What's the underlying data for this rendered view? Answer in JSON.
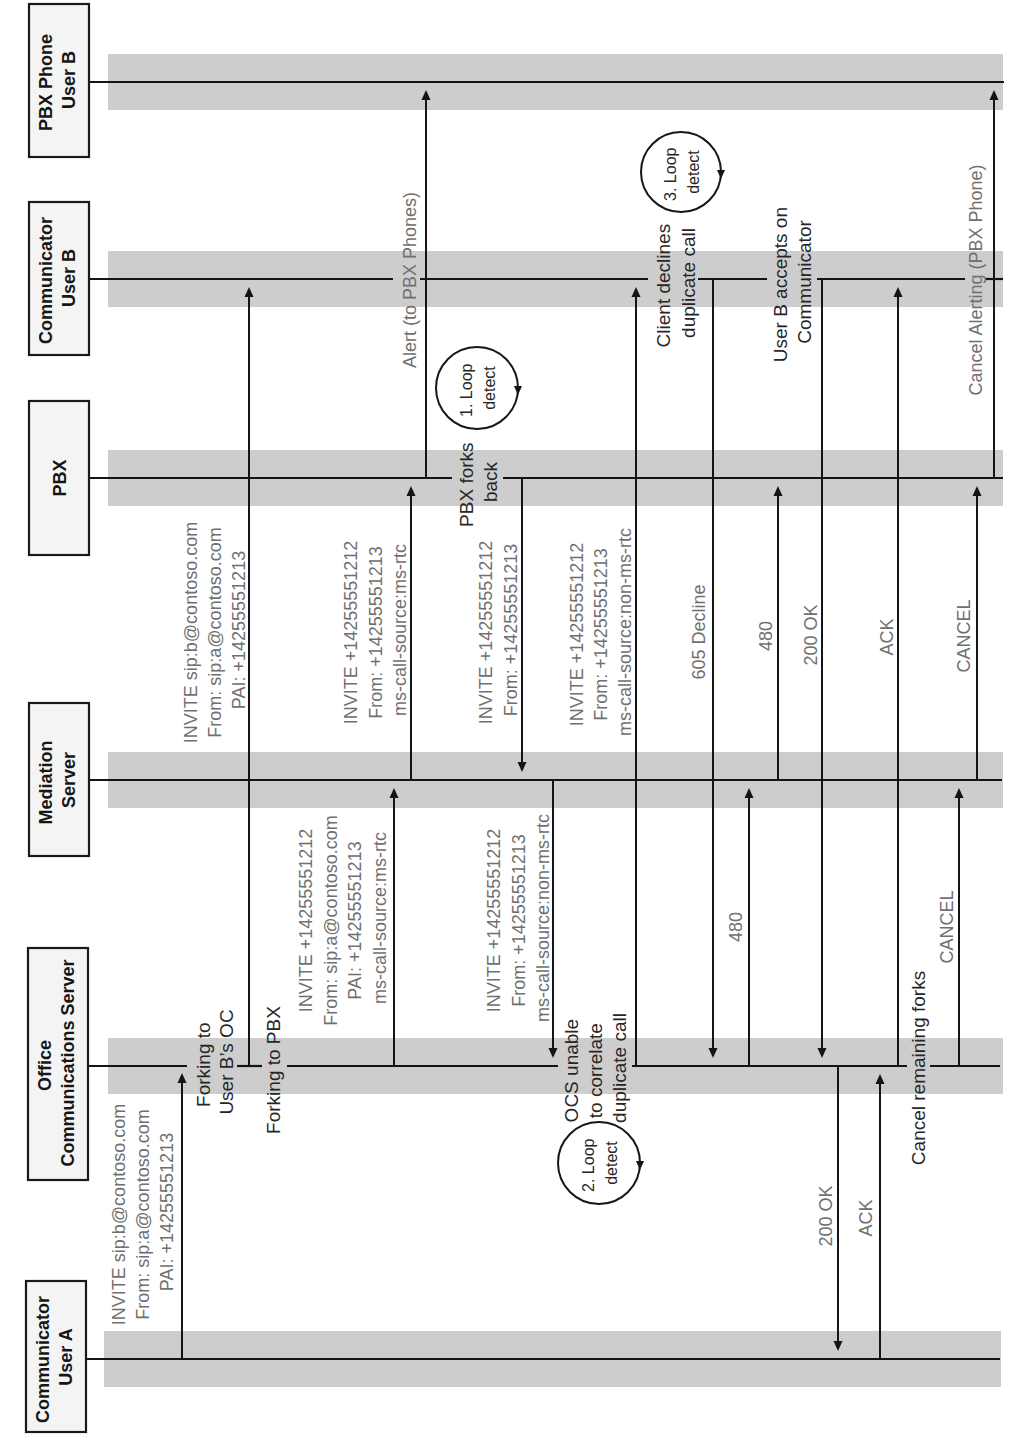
{
  "diagram": {
    "participants": [
      {
        "name": "PBX Phone User B",
        "lines": [
          "PBX Phone",
          "User B"
        ]
      },
      {
        "name": "Communicator User B",
        "lines": [
          "Communicator",
          "User B"
        ]
      },
      {
        "name": "PBX",
        "lines": [
          "PBX"
        ]
      },
      {
        "name": "Mediation Server",
        "lines": [
          "Mediation",
          "Server"
        ]
      },
      {
        "name": "Office Communications Server",
        "lines": [
          "Office",
          "Communications Server"
        ]
      },
      {
        "name": "Communicator User A",
        "lines": [
          "Communicator",
          "User A"
        ]
      }
    ],
    "messages": [
      {
        "from": "Communicator User A",
        "to": "Office Communications Server",
        "lines": [
          "INVITE sip:b@contoso.com",
          "From: sip:a@contoso.com",
          "PAI: +14255551213"
        ]
      },
      {
        "from": "Office Communications Server",
        "to": "Communicator User B",
        "lines": [
          "INVITE sip:b@contoso.com",
          "From: sip:a@contoso.com",
          "PAI: +14255551213"
        ]
      },
      {
        "from": "Office Communications Server",
        "to": "Mediation Server",
        "lines": [
          "INVITE +14255551212",
          "From: sip:a@contoso.com",
          "PAI: +14255551213",
          "ms-call-source:ms-rtc"
        ]
      },
      {
        "from": "Mediation Server",
        "to": "PBX",
        "lines": [
          "INVITE +14255551212",
          "From: +14255551213",
          "ms-call-source:ms-rtc"
        ]
      },
      {
        "from": "PBX",
        "to": "PBX Phone User B",
        "lines": [
          "Alert (to PBX Phones)"
        ]
      },
      {
        "from": "PBX",
        "to": "Mediation Server",
        "lines": [
          "INVITE +14255551212",
          "From: +14255551213"
        ]
      },
      {
        "from": "Mediation Server",
        "to": "Office Communications Server",
        "lines": [
          "INVITE +14255551212",
          "From: +14255551213",
          "ms-call-source:non-ms-rtc"
        ]
      },
      {
        "from": "Office Communications Server",
        "to": "Communicator User B",
        "lines": [
          "INVITE +14255551212",
          "From: +14255551213",
          "ms-call-source:non-ms-rtc"
        ]
      },
      {
        "from": "Communicator User B",
        "to": "Office Communications Server",
        "lines": [
          "605 Decline"
        ]
      },
      {
        "from": "Office Communications Server",
        "to": "Mediation Server",
        "lines": [
          "480"
        ]
      },
      {
        "from": "Mediation Server",
        "to": "PBX",
        "lines": [
          "480"
        ]
      },
      {
        "from": "Communicator User B",
        "to": "Office Communications Server",
        "lines": [
          "200 OK"
        ]
      },
      {
        "from": "Office Communications Server",
        "to": "Communicator User A",
        "lines": [
          "200 OK"
        ]
      },
      {
        "from": "Communicator User A",
        "to": "Office Communications Server",
        "lines": [
          "ACK"
        ]
      },
      {
        "from": "Office Communications Server",
        "to": "Communicator User B",
        "lines": [
          "ACK"
        ]
      },
      {
        "from": "Office Communications Server",
        "to": "Mediation Server",
        "lines": [
          "CANCEL"
        ]
      },
      {
        "from": "Mediation Server",
        "to": "PBX",
        "lines": [
          "CANCEL"
        ]
      },
      {
        "from": "PBX",
        "to": "PBX Phone User B",
        "lines": [
          "Cancel Alerting (PBX Phone)"
        ]
      }
    ],
    "notes": [
      {
        "on": "Office Communications Server",
        "lines": [
          "Forking to",
          "User B’s OC"
        ]
      },
      {
        "on": "Office Communications Server",
        "lines": [
          "Forking to PBX"
        ]
      },
      {
        "on": "PBX",
        "lines": [
          "PBX forks",
          "back"
        ]
      },
      {
        "on": "Office Communications Server",
        "lines": [
          "OCS unable",
          "to correlate",
          "duplicate call"
        ]
      },
      {
        "on": "Communicator User B",
        "lines": [
          "Client declines",
          "duplicate call"
        ]
      },
      {
        "on": "Communicator User B",
        "lines": [
          "User B accepts on",
          "Communicator"
        ]
      },
      {
        "on": "Office Communications Server",
        "lines": [
          "Cancel remaining forks"
        ]
      }
    ],
    "loop_detects": [
      {
        "lines": [
          "1. Loop",
          "detect"
        ]
      },
      {
        "lines": [
          "2. Loop",
          "detect"
        ]
      },
      {
        "lines": [
          "3. Loop",
          "detect"
        ]
      }
    ]
  },
  "colors": {
    "lane_band": "#cdcdcd",
    "line": "#141414",
    "participant_box_fill": "#f4f4f4",
    "message_label": "#707070",
    "note_text": "#262626"
  }
}
